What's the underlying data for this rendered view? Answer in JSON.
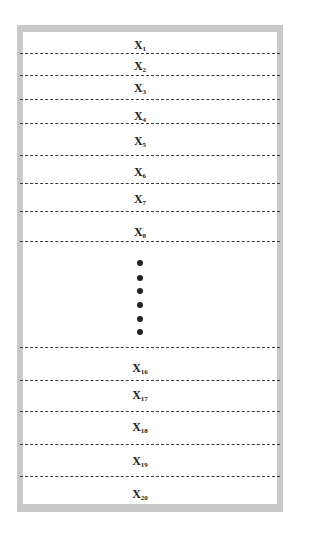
{
  "diagram": {
    "type": "stacked-partition-list",
    "frame_color": "#c9c9c9",
    "line_color": "#3a3a3a",
    "rows": [
      {
        "name": "X",
        "sub": "1",
        "y": 45
      },
      {
        "name": "X",
        "sub": "2",
        "y": 66
      },
      {
        "name": "X",
        "sub": "3",
        "y": 88
      },
      {
        "name": "X",
        "sub": "4",
        "y": 116
      },
      {
        "name": "X",
        "sub": "5",
        "y": 141
      },
      {
        "name": "X",
        "sub": "6",
        "y": 172
      },
      {
        "name": "X",
        "sub": "7",
        "y": 199
      },
      {
        "name": "X",
        "sub": "8",
        "y": 232
      },
      {
        "name": "X",
        "sub": "16",
        "y": 368
      },
      {
        "name": "X",
        "sub": "17",
        "y": 395
      },
      {
        "name": "X",
        "sub": "18",
        "y": 427
      },
      {
        "name": "X",
        "sub": "19",
        "y": 461
      },
      {
        "name": "X",
        "sub": "20",
        "y": 494
      }
    ],
    "dividers_y": [
      54,
      76,
      100,
      124,
      156,
      184,
      212,
      242,
      348,
      381,
      412,
      445,
      477
    ],
    "ellipsis_dots_y": [
      263,
      278,
      291,
      305,
      319,
      332
    ]
  }
}
